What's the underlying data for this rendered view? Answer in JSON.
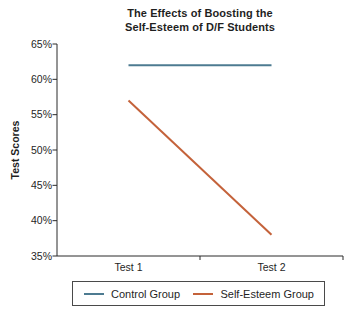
{
  "chart_data": {
    "type": "line",
    "title_lines": [
      "The Effects of Boosting the",
      "Self-Esteem of D/F Students"
    ],
    "ylabel": "Test Scores",
    "categories": [
      "Test 1",
      "Test 2"
    ],
    "series": [
      {
        "name": "Control Group",
        "color": "#4d7b91",
        "values": [
          62,
          62
        ]
      },
      {
        "name": "Self-Esteem Group",
        "color": "#c4623a",
        "values": [
          57,
          38
        ]
      }
    ],
    "ylim": [
      35,
      65
    ],
    "ytick_step": 5,
    "ytick_labels": [
      "65%",
      "60%",
      "55%",
      "50%",
      "45%",
      "40%",
      "35%"
    ],
    "grid": false,
    "point_markers": false,
    "legend_position": "bottom",
    "axis_color": "#2b2b2b",
    "text_color": "#1f1f1f",
    "background_color": "#ffffff"
  }
}
